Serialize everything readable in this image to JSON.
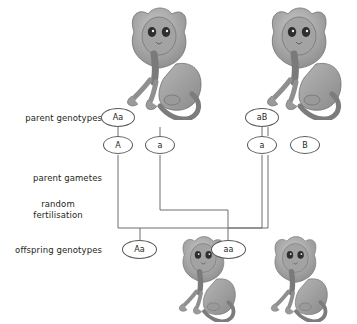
{
  "diagram": {
    "background_color": "#ffffff",
    "line_color": "#6d6e71",
    "text_color": "#231f20",
    "oval_border_color": "#58595b"
  },
  "row_labels": {
    "parent_genotypes": "parent genotypes",
    "parent_gametes": "parent gametes",
    "random_fertilisation_line1": "random",
    "random_fertilisation_line2": "fertilisation",
    "offspring_genotypes": "offspring genotypes"
  },
  "parent_genotypes": [
    {
      "allele_pair": "Aa",
      "x": 118,
      "y": 117
    },
    {
      "allele_pair": "aB",
      "x": 262,
      "y": 117
    }
  ],
  "parent_gametes": [
    {
      "allele": "A",
      "x": 118,
      "y": 145
    },
    {
      "allele": "a",
      "x": 160,
      "y": 145
    },
    {
      "allele": "a",
      "x": 262,
      "y": 145
    },
    {
      "allele": "B",
      "x": 305,
      "y": 145
    }
  ],
  "offspring_genotypes": [
    {
      "allele_pair": "Aa",
      "x": 140,
      "y": 249
    },
    {
      "allele_pair": "aa",
      "x": 228,
      "y": 249
    }
  ],
  "organisms": [
    {
      "name": "parent-monkey-left",
      "role": "parent",
      "x": 104,
      "y": 2,
      "width": 104,
      "height": 118
    },
    {
      "name": "parent-monkey-right",
      "role": "parent",
      "x": 244,
      "y": 2,
      "width": 104,
      "height": 118
    },
    {
      "name": "offspring-monkey-left",
      "role": "offspring",
      "x": 158,
      "y": 232,
      "width": 86,
      "height": 90
    },
    {
      "name": "offspring-monkey-right",
      "role": "offspring",
      "x": 250,
      "y": 232,
      "width": 86,
      "height": 90
    }
  ],
  "connectors": {
    "upper_rail_y": 210,
    "lower_rail_y": 228,
    "description": "gamete a (left parent) and gamete a (right parent) cross to offspring ovals"
  }
}
